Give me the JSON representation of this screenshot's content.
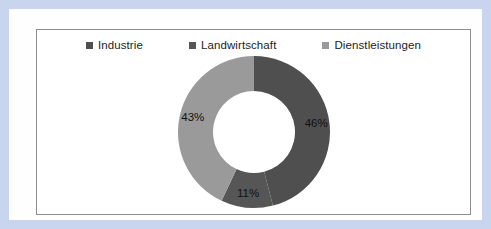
{
  "chart_data": {
    "type": "pie",
    "variant": "donut",
    "title": "",
    "subtitle": "",
    "xlabel": "",
    "ylabel": "",
    "grid": false,
    "legend_position": "top",
    "start_angle_deg": 0,
    "direction": "clockwise",
    "categories": [
      "Industrie",
      "Landwirtschaft",
      "Dienstleistungen"
    ],
    "values": [
      46,
      11,
      43
    ],
    "unit": "%",
    "data_labels": [
      "46%",
      "11%",
      "43%"
    ],
    "colors": [
      "#4f4f4f",
      "#565656",
      "#9a9a9a"
    ],
    "slices": [
      {
        "label": "Industrie",
        "value": 46,
        "data_label": "46%",
        "color": "#4f4f4f",
        "start_deg": 0,
        "end_deg": 165.6
      },
      {
        "label": "Landwirtschaft",
        "value": 11,
        "data_label": "11%",
        "color": "#565656",
        "start_deg": 165.6,
        "end_deg": 205.2
      },
      {
        "label": "Dienstleistungen",
        "value": 43,
        "data_label": "43%",
        "color": "#9a9a9a",
        "start_deg": 205.2,
        "end_deg": 360
      }
    ]
  },
  "legend": {
    "items": [
      {
        "label": "Industrie",
        "color": "#4f4f4f"
      },
      {
        "label": "Landwirtschaft",
        "color": "#565656"
      },
      {
        "label": "Dienstleistungen",
        "color": "#9a9a9a"
      }
    ]
  },
  "labels": {
    "industrie": "46%",
    "landwirtschaft": "11%",
    "dienstleistungen": "43%"
  },
  "colors": {
    "page_border": "#c9d4ef",
    "page_background": "#fefeff",
    "chart_background": "#ffffff",
    "chart_border": "#8d8d8d",
    "dark_slice": "#4f4f4f",
    "mid_slice": "#565656",
    "light_slice": "#9a9a9a",
    "label_text": "#1d1d1d"
  }
}
